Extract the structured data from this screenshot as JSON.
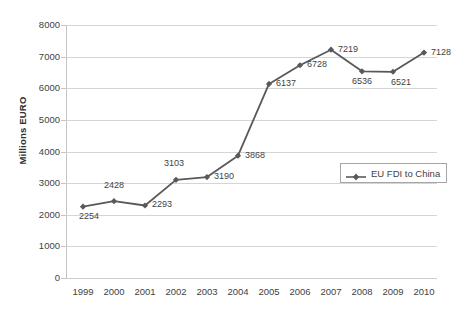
{
  "chart_data": {
    "type": "line",
    "title": "",
    "xlabel": "",
    "ylabel": "Millions EURO",
    "categories": [
      "1999",
      "2000",
      "2001",
      "2002",
      "2003",
      "2004",
      "2005",
      "2006",
      "2007",
      "2008",
      "2009",
      "2010"
    ],
    "series": [
      {
        "name": "EU FDI to China",
        "values": [
          2254,
          2428,
          2293,
          3103,
          3190,
          3868,
          6137,
          6728,
          7219,
          6536,
          6521,
          7128
        ],
        "color": "#595959",
        "marker": "diamond",
        "show_data_labels": true
      }
    ],
    "ylim": [
      0,
      8000
    ],
    "yticks": [
      0,
      1000,
      2000,
      3000,
      4000,
      5000,
      6000,
      7000,
      8000
    ],
    "ytick_labels": [
      "0",
      "1000",
      "2000",
      "3000",
      "4000",
      "5000",
      "6000",
      "7000",
      "8000"
    ],
    "grid": "horizontal",
    "legend_position": "inside-right-center",
    "legend_entries": [
      "EU FDI to China"
    ],
    "data_label_offsets": [
      {
        "year": "1999",
        "value": 2254,
        "pos": "below-left"
      },
      {
        "year": "2000",
        "value": 2428,
        "pos": "above"
      },
      {
        "year": "2001",
        "value": 2293,
        "pos": "right"
      },
      {
        "year": "2002",
        "value": 3103,
        "pos": "above-left"
      },
      {
        "year": "2003",
        "value": 3190,
        "pos": "right"
      },
      {
        "year": "2004",
        "value": 3868,
        "pos": "right"
      },
      {
        "year": "2005",
        "value": 6137,
        "pos": "right"
      },
      {
        "year": "2006",
        "value": 6728,
        "pos": "right"
      },
      {
        "year": "2007",
        "value": 7219,
        "pos": "right"
      },
      {
        "year": "2008",
        "value": 6536,
        "pos": "below"
      },
      {
        "year": "2009",
        "value": 6521,
        "pos": "below-right"
      },
      {
        "year": "2010",
        "value": 7128,
        "pos": "right"
      }
    ]
  },
  "legend": {
    "label": "EU FDI to China"
  },
  "axis": {
    "y_title": "Millions EURO"
  }
}
